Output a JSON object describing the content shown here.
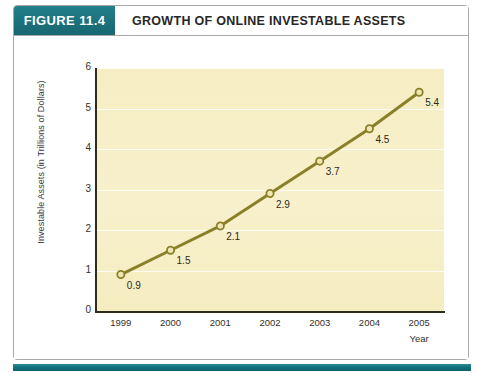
{
  "figure": {
    "tag": "FIGURE 11.4",
    "title": "GROWTH OF ONLINE INVESTABLE ASSETS",
    "source_note": "",
    "accent_color": "#17717c",
    "plot_background": "#f7eec4",
    "series_color": "#8a8029"
  },
  "chart_data": {
    "type": "line",
    "title": "GROWTH OF ONLINE INVESTABLE ASSETS",
    "xlabel": "Year",
    "ylabel": "Investable Assets (in Trillions of Dollars)",
    "categories": [
      "1999",
      "2000",
      "2001",
      "2002",
      "2003",
      "2004",
      "2005"
    ],
    "values": [
      0.9,
      1.5,
      2.1,
      2.9,
      3.7,
      4.5,
      5.4
    ],
    "point_labels": [
      "0.9",
      "1.5",
      "2.1",
      "2.9",
      "3.7",
      "4.5",
      "5.4"
    ],
    "ylim": [
      0,
      6
    ],
    "yticks": [
      0,
      1,
      2,
      3,
      4,
      5,
      6
    ],
    "ytick_labels": [
      "0",
      "1",
      "2",
      "3",
      "4",
      "5",
      "6"
    ],
    "grid": true,
    "grid_axis": "y",
    "legend": false,
    "marker": "circle",
    "series": [
      {
        "name": "Investable Assets",
        "values": [
          0.9,
          1.5,
          2.1,
          2.9,
          3.7,
          4.5,
          5.4
        ]
      }
    ]
  }
}
